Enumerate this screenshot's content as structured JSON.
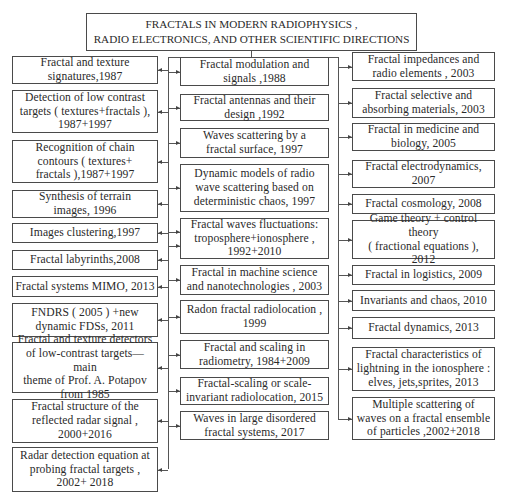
{
  "title": "FRACTALS IN MODERN RADIOPHYSICS ,\nRADIO ELECTRONICS,   AND OTHER SCIENTIFIC DIRECTIONS",
  "columns": {
    "left": [
      {
        "label": "Fractal and texture\nsignatures,1987",
        "top": 56,
        "h": 28
      },
      {
        "label": "Detection of low contrast\ntargets ( textures+fractals ),\n1987+1997",
        "top": 90,
        "h": 43
      },
      {
        "label": "Recognition of chain\ncontours ( textures+\nfractals ),1987+1997",
        "top": 140,
        "h": 43
      },
      {
        "label": "Synthesis of terrain\nimages,  1996",
        "top": 190,
        "h": 28
      },
      {
        "label": "Images clustering,1997",
        "top": 223,
        "h": 20
      },
      {
        "label": "Fractal labyrinths,2008",
        "top": 250,
        "h": 20
      },
      {
        "label": "Fractal systems MIMO, 2013",
        "top": 276,
        "h": 21
      },
      {
        "label": "FNDRS ( 2005 ) +new\ndynamic FDSs,  2011",
        "top": 303,
        "h": 34
      },
      {
        "label": "Fractal and texture detectors\nof low-contrast targets—main\ntheme of Prof. A. Potapov\nfrom 1985",
        "top": 342,
        "h": 51
      },
      {
        "label": "Fractal structure of the\nreflected radar signal ,\n2000+2016",
        "top": 399,
        "h": 44
      },
      {
        "label": "Radar detection equation at\nprobing fractal targets ,\n2002+ 2018",
        "top": 447,
        "h": 45
      }
    ],
    "middle": [
      {
        "label": "Fractal modulation and\nsignals ,1988",
        "top": 57,
        "h": 29
      },
      {
        "label": "Fractal antennas and their\ndesign ,1992",
        "top": 94,
        "h": 27
      },
      {
        "label": "Waves scattering by a\nfractal surface,  1997",
        "top": 128,
        "h": 30
      },
      {
        "label": "Dynamic models of radio\nwave scattering based on\ndeterministic chaos,  1997",
        "top": 164,
        "h": 48
      },
      {
        "label": "Fractal waves fluctuations:\ntroposphere+ionosphere ,\n1992+2010",
        "top": 218,
        "h": 41
      },
      {
        "label": "Fractal in machine science\nand nanotechnologies , 2003",
        "top": 265,
        "h": 30
      },
      {
        "label": "Radon fractal radiolocation ,\n1999",
        "top": 300,
        "h": 34
      },
      {
        "label": "Fractal and scaling in\nradiometry,  1984+2009",
        "top": 340,
        "h": 29
      },
      {
        "label": "Fractal-scaling or scale-\ninvariant radiolocation, 2015",
        "top": 377,
        "h": 28
      },
      {
        "label": "Waves in large disordered\nfractal systems, 2017",
        "top": 411,
        "h": 29
      }
    ],
    "right": [
      {
        "label": "Fractal impedances and\nradio elements , 2003",
        "top": 52,
        "h": 29
      },
      {
        "label": "Fractal selective and\nabsorbing materials, 2003",
        "top": 88,
        "h": 30
      },
      {
        "label": "Fractal in medicine and\nbiology, 2005",
        "top": 123,
        "h": 28
      },
      {
        "label": "Fractal electrodynamics,\n2007",
        "top": 160,
        "h": 28
      },
      {
        "label": "Fractal cosmology, 2008",
        "top": 194,
        "h": 20
      },
      {
        "label": "Game theory + control theory\n( fractional  equations ),\n2012",
        "top": 220,
        "h": 39
      },
      {
        "label": "Fractal in logistics, 2009",
        "top": 265,
        "h": 20
      },
      {
        "label": "Invariants and chaos, 2010",
        "top": 290,
        "h": 21
      },
      {
        "label": "Fractal dynamics, 2013",
        "top": 317,
        "h": 22
      },
      {
        "label": "Fractal characteristics of\nlightning in the ionosphere :\nelves, jets,sprites, 2013",
        "top": 347,
        "h": 44
      },
      {
        "label": "Multiple scattering of\nwaves on a fractal ensemble\nof particles ,2002+2018",
        "top": 397,
        "h": 43
      }
    ]
  },
  "colors": {
    "border": "#4a4a4a",
    "line": "#555555",
    "text": "#2a2a2a",
    "background": "#ffffff"
  }
}
